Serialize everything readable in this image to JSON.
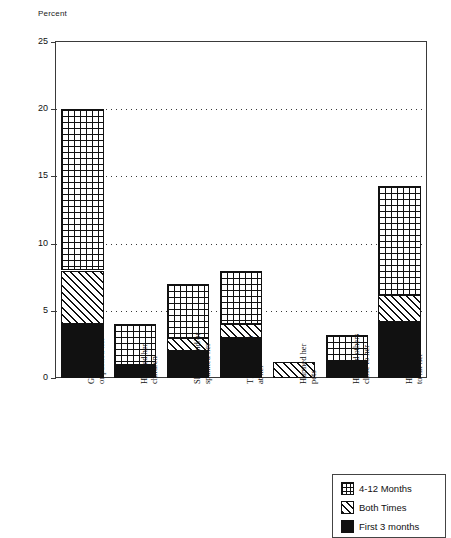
{
  "chart_data": {
    "type": "bar",
    "subtype": "stacked-vertical",
    "title": "",
    "xlabel": "",
    "ylabel": "Percent",
    "ylim": [
      0,
      25
    ],
    "ytick_values": [
      0,
      5,
      10,
      15,
      20,
      25
    ],
    "ytick_labels": [
      "0",
      "5",
      "10",
      "15",
      "20",
      "25"
    ],
    "grid": "horizontal-dotted-at-5-10-15-20",
    "legend_position": "bottom-right",
    "categories": [
      "Grabbed, shoved,\nor pushed her",
      "Harmed her\nchildren",
      "Slapped and/or\nspanked her",
      "Threw objects\nat her",
      "Harmed her\npets",
      "Harmed others\nclose to her",
      "Hit or tried\nto hit her"
    ],
    "series": [
      {
        "name": "First 3 months",
        "pattern": "solid",
        "values": [
          4.0,
          1.0,
          2.0,
          3.0,
          0.0,
          1.3,
          4.2
        ]
      },
      {
        "name": "Both Times",
        "pattern": "diagonal",
        "values": [
          4.0,
          0.0,
          1.0,
          1.0,
          1.2,
          0.0,
          2.0
        ]
      },
      {
        "name": "4-12 Months",
        "pattern": "grid",
        "values": [
          12.0,
          3.0,
          4.0,
          4.0,
          0.0,
          1.9,
          8.1
        ]
      }
    ],
    "totals": [
      20.0,
      4.0,
      7.0,
      8.0,
      1.2,
      3.2,
      14.3
    ]
  },
  "legend": {
    "items": [
      {
        "label": "4-12 Months",
        "swatch": "grid-swatch"
      },
      {
        "label": "Both Times",
        "swatch": "hatch-swatch"
      },
      {
        "label": "First 3 months",
        "swatch": "solid-swatch"
      }
    ]
  },
  "colors": {
    "ink": "#111111",
    "frame": "#3a3a3a",
    "background": "#ffffff"
  }
}
